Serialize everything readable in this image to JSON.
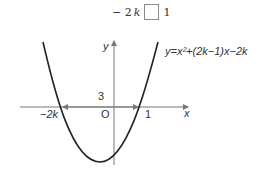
{
  "condition": {
    "left": "− 2",
    "left_var": "k",
    "blank": "",
    "right": "1"
  },
  "graph": {
    "equation": "y=x²+(2k−1)x−2k",
    "y_axis_label": "y",
    "x_axis_label": "x",
    "origin_label": "O",
    "left_root_label": "−2k",
    "right_root_label": "1",
    "distance_label": "3",
    "colors": {
      "curve": "#222222",
      "axes": "#777777"
    }
  }
}
